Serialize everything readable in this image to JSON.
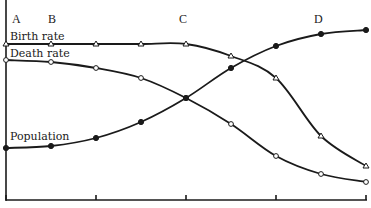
{
  "chart_data": {
    "type": "line",
    "title": "",
    "xlabel": "",
    "ylabel": "",
    "grid": false,
    "legend": "inline labels",
    "stage_labels": [
      {
        "label": "A",
        "x": 16
      },
      {
        "label": "B",
        "x": 52
      },
      {
        "label": "C",
        "x": 183
      },
      {
        "label": "D",
        "x": 318
      }
    ],
    "x": [
      0,
      1,
      2,
      3,
      4,
      5,
      6,
      7,
      8
    ],
    "x_ticks": [
      0,
      2,
      4,
      6,
      8
    ],
    "ylim": [
      0,
      100
    ],
    "series": [
      {
        "name": "Birth rate",
        "marker": "open-triangle",
        "values": [
          78,
          78,
          78,
          78,
          78,
          72,
          61,
          32,
          17
        ]
      },
      {
        "name": "Death rate",
        "marker": "open-circle",
        "values": [
          70,
          69,
          66,
          61,
          51,
          38,
          22,
          13,
          9
        ]
      },
      {
        "name": "Population",
        "marker": "filled-circle",
        "values": [
          26,
          27,
          31,
          39,
          51,
          66,
          77,
          83,
          85
        ]
      }
    ]
  },
  "labels": {
    "stage_a": "A",
    "stage_b": "B",
    "stage_c": "C",
    "stage_d": "D",
    "birth_rate": "Birth rate",
    "death_rate": "Death rate",
    "population": "Population"
  },
  "colors": {
    "ink": "#1a1a1a",
    "background": "#ffffff"
  }
}
